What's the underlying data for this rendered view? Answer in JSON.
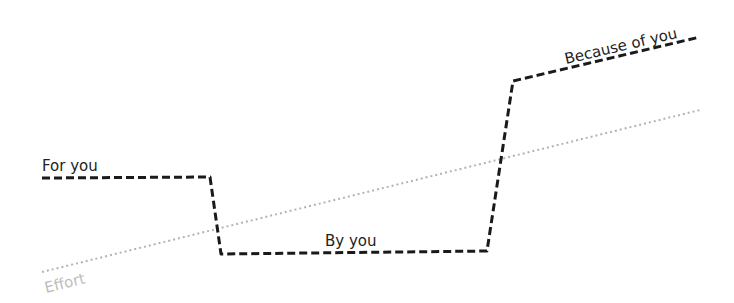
{
  "diagram": {
    "colors": {
      "main_line": "#1a1a1a",
      "effort_line": "#b3b3b3",
      "label": "#222222",
      "effort_label": "#bdbdbd"
    },
    "path_segments": [
      {
        "label": "For you",
        "points": [
          [
            42,
            178
          ],
          [
            210,
            177
          ],
          [
            221,
            254
          ]
        ]
      },
      {
        "label": "By you",
        "points": [
          [
            221,
            254
          ],
          [
            487,
            251
          ],
          [
            513,
            81
          ]
        ]
      },
      {
        "label": "Because of you",
        "points": [
          [
            513,
            81
          ],
          [
            700,
            37
          ]
        ]
      }
    ],
    "effort_line": {
      "label": "Effort",
      "points": [
        [
          42,
          272
        ],
        [
          700,
          110
        ]
      ]
    },
    "labels": {
      "for_you": "For you",
      "by_you": "By you",
      "because_of_you": "Because of you",
      "effort": "Effort"
    }
  }
}
